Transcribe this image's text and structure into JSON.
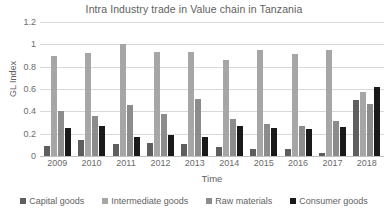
{
  "chart_data": {
    "type": "bar",
    "title": "Intra Industry trade in Value chain in Tanzania",
    "xlabel": "Time",
    "ylabel": "GL Index",
    "categories": [
      "2009",
      "2010",
      "2011",
      "2012",
      "2013",
      "2014",
      "2015",
      "2016",
      "2017",
      "2018"
    ],
    "ylim": [
      0,
      1.2
    ],
    "ytick_labels": [
      "1.2",
      "1",
      "0.8",
      "0.6",
      "0.4",
      "0.2",
      "0"
    ],
    "ytick_values": [
      1.2,
      1,
      0.8,
      0.6,
      0.4,
      0.2,
      0
    ],
    "grid": true,
    "legend_position": "bottom",
    "series": [
      {
        "name": "Capital goods",
        "color": "#5e5e5e",
        "values": [
          0.09,
          0.14,
          0.11,
          0.12,
          0.11,
          0.08,
          0.06,
          0.06,
          0.03,
          0.5
        ]
      },
      {
        "name": "Intermediate goods",
        "color": "#a6a6a6",
        "values": [
          0.9,
          0.92,
          1.0,
          0.93,
          0.93,
          0.86,
          0.95,
          0.91,
          0.95,
          0.57
        ]
      },
      {
        "name": "Raw materials",
        "color": "#8c8c8c",
        "values": [
          0.4,
          0.36,
          0.46,
          0.38,
          0.51,
          0.33,
          0.29,
          0.27,
          0.31,
          0.47
        ]
      },
      {
        "name": "Consumer goods",
        "color": "#1a1a1a",
        "values": [
          0.25,
          0.27,
          0.17,
          0.19,
          0.17,
          0.27,
          0.25,
          0.24,
          0.26,
          0.62
        ]
      }
    ]
  }
}
